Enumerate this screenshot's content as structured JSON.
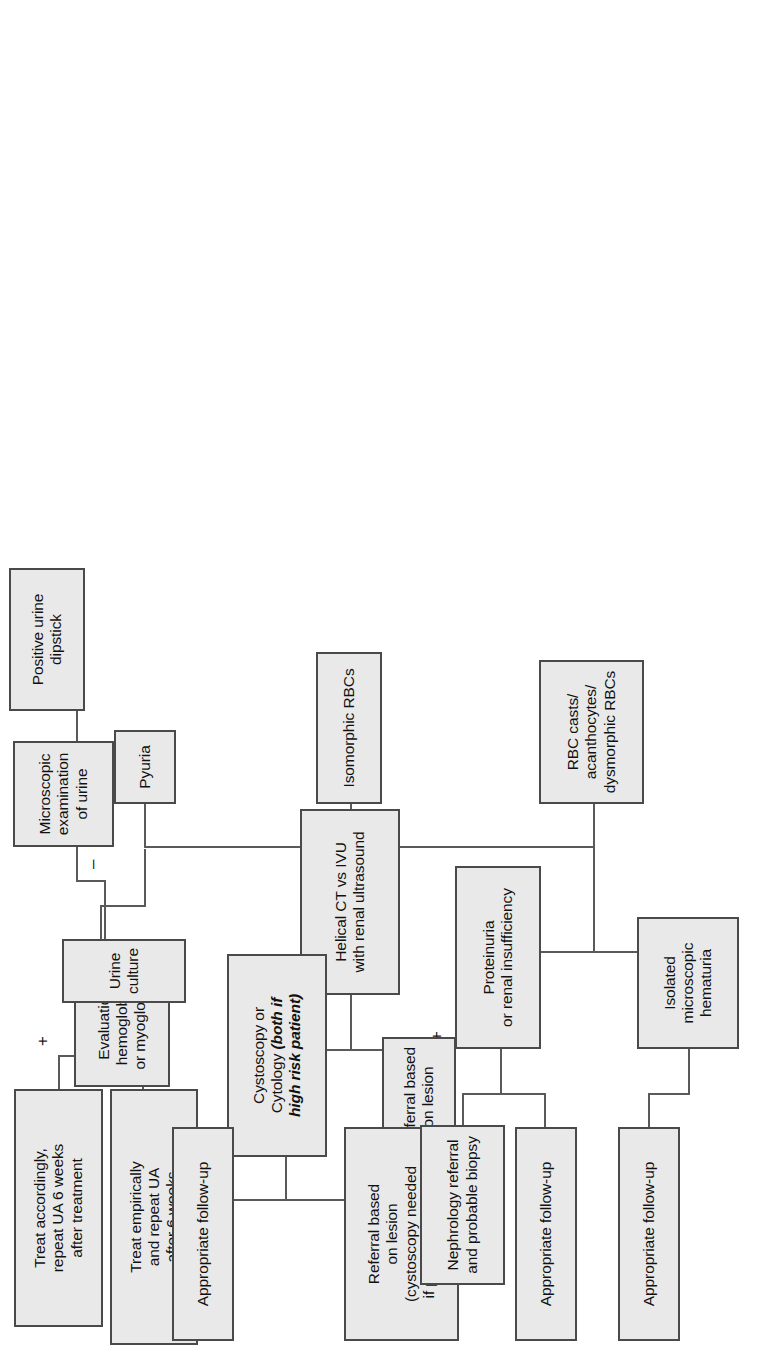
{
  "figure": {
    "kind": "clinical-algorithm-flowchart",
    "orientation": "rotated-90-counterclockwise",
    "palette": {
      "node_fill": "#e9e9e9",
      "node_border": "#4a4a4a",
      "connector": "#5a5a5a",
      "text": "#111111",
      "background": "#ffffff"
    }
  },
  "nodes": {
    "positive_urine_dipstick": "Positive urine\ndipstick",
    "microscopic_examination": "Microscopic\nexamination\nof urine",
    "evaluation_hemoglobinuria": "Evaluation for\nhemoglobinuria\nor myoglobinuria",
    "pyuria": "Pyuria",
    "urine_culture": "Urine culture",
    "treat_accordingly": "Treat accordingly,\nrepeat UA 6 weeks\nafter treatment",
    "treat_empirically": "Treat empirically\nand repeat UA\nafter 6 weeks",
    "isomorphic_rbcs": "Isomorphic RBCs",
    "helical_ct": "Helical CT vs IVU\nwith renal ultrasound",
    "referral_lesion_upper": "Referral based\non lesion",
    "cystoscopy_cytology_line1": "Cystoscopy or",
    "cystoscopy_cytology_line2": "Cytology ",
    "cystoscopy_cytology_emph": "(both if\nhigh risk patient)",
    "appropriate_followup_cysto": "Appropriate follow-up",
    "referral_lesion_lower": "Referral based\non lesion\n(cystoscopy needed\nif positive cytology)",
    "rbc_casts": "RBC casts/\nacanthocytes/\ndysmorphic RBCs",
    "proteinuria": "Proteinuria\nor renal insufficiency",
    "nephrology_referral": "Nephrology referral\nand probable biopsy",
    "appropriate_followup_proteinuria": "Appropriate follow-up",
    "isolated_microscopic_hematuria": "Isolated\nmicroscopic\nhematuria",
    "appropriate_followup_isolated": "Appropriate follow-up"
  },
  "edge_labels": {
    "micro_negative": "–",
    "micro_positive": "+",
    "culture_positive": "+",
    "culture_negative": "–",
    "ct_positive": "+",
    "ct_negative": "–",
    "cysto_negative": "–",
    "cysto_positive": "+"
  },
  "flow": [
    {
      "from": "positive_urine_dipstick",
      "to": "microscopic_examination",
      "label": ""
    },
    {
      "from": "microscopic_examination",
      "to": "evaluation_hemoglobinuria",
      "label": "–"
    },
    {
      "from": "microscopic_examination",
      "to": "pyuria",
      "label": "+"
    },
    {
      "from": "microscopic_examination",
      "to": "isomorphic_rbcs",
      "label": "+"
    },
    {
      "from": "microscopic_examination",
      "to": "rbc_casts",
      "label": "+"
    },
    {
      "from": "pyuria",
      "to": "urine_culture",
      "label": ""
    },
    {
      "from": "urine_culture",
      "to": "treat_accordingly",
      "label": "+"
    },
    {
      "from": "urine_culture",
      "to": "treat_empirically",
      "label": "–"
    },
    {
      "from": "isomorphic_rbcs",
      "to": "helical_ct",
      "label": ""
    },
    {
      "from": "helical_ct",
      "to": "referral_lesion_upper",
      "label": "+"
    },
    {
      "from": "helical_ct",
      "to": "cystoscopy_cytology",
      "label": "–"
    },
    {
      "from": "cystoscopy_cytology",
      "to": "appropriate_followup_cysto",
      "label": "–"
    },
    {
      "from": "cystoscopy_cytology",
      "to": "referral_lesion_lower",
      "label": "+"
    },
    {
      "from": "rbc_casts",
      "to": "proteinuria",
      "label": ""
    },
    {
      "from": "rbc_casts",
      "to": "isolated_microscopic_hematuria",
      "label": ""
    },
    {
      "from": "proteinuria",
      "to": "nephrology_referral",
      "label": ""
    },
    {
      "from": "proteinuria",
      "to": "appropriate_followup_proteinuria",
      "label": ""
    },
    {
      "from": "isolated_microscopic_hematuria",
      "to": "appropriate_followup_isolated",
      "label": ""
    }
  ]
}
